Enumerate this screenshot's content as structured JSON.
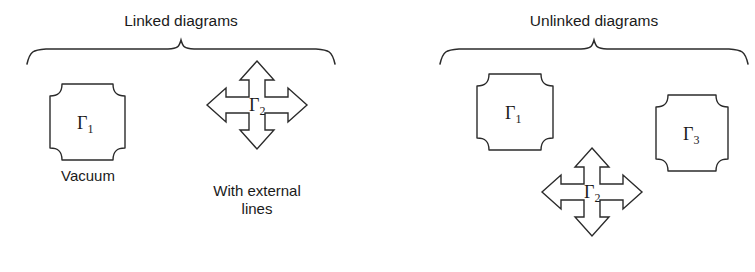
{
  "figure": {
    "title_left": "Linked diagrams",
    "title_right": "Unlinked diagrams",
    "background_color": "#ffffff",
    "line_color": "#2b2b2b",
    "text_color": "#1a1a1a"
  },
  "groups": [
    {
      "id": "linked",
      "title": "Linked diagrams",
      "items": [
        {
          "id": "linked-gamma1",
          "shape": "blob",
          "symbol": "Γ",
          "subscript": "1",
          "caption": "Vacuum"
        },
        {
          "id": "linked-gamma2",
          "shape": "four-way-arrow",
          "symbol": "Γ",
          "subscript": "2",
          "caption_line1": "With external",
          "caption_line2": "lines"
        }
      ]
    },
    {
      "id": "unlinked",
      "title": "Unlinked diagrams",
      "items": [
        {
          "id": "unlinked-gamma1",
          "shape": "blob",
          "symbol": "Γ",
          "subscript": "1"
        },
        {
          "id": "unlinked-gamma3",
          "shape": "blob",
          "symbol": "Γ",
          "subscript": "3"
        },
        {
          "id": "unlinked-gamma2",
          "shape": "four-way-arrow",
          "symbol": "Γ",
          "subscript": "2"
        }
      ]
    }
  ],
  "labels": {
    "vacuum": "Vacuum",
    "with_external_line1": "With external",
    "with_external_lines_line2": "lines"
  }
}
